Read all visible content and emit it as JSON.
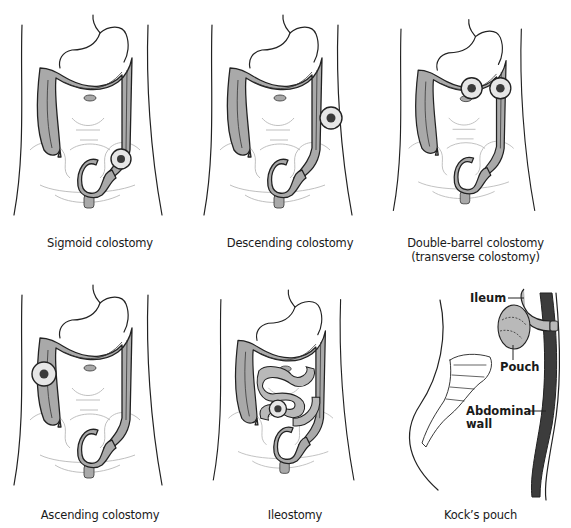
{
  "figure": {
    "type": "medical-illustration",
    "panels": [
      {
        "id": "sigmoid",
        "caption_lines": [
          "Sigmoid colostomy"
        ],
        "stoma": "sigmoid"
      },
      {
        "id": "descending",
        "caption_lines": [
          "Descending colostomy"
        ],
        "stoma": "descending"
      },
      {
        "id": "double-barrel",
        "caption_lines": [
          "Double-barrel colostomy",
          "(transverse colostomy)"
        ],
        "stoma": "transverse-double"
      },
      {
        "id": "ascending",
        "caption_lines": [
          "Ascending colostomy"
        ],
        "stoma": "ascending"
      },
      {
        "id": "ileostomy",
        "caption_lines": [
          "Ileostomy"
        ],
        "stoma": "ileum"
      },
      {
        "id": "kocks-pouch",
        "caption_lines": [
          "Kock’s pouch"
        ],
        "callouts": {
          "ileum": "Ileum",
          "pouch": "Pouch",
          "abdominal_wall_1": "Abdominal",
          "abdominal_wall_2": "wall"
        }
      }
    ]
  },
  "colors": {
    "colon_fill": "#a9a9a9",
    "outline": "#222222",
    "faint_bone": "#b8b8b8",
    "abdominal_wall": "#3c3c3c",
    "stoma_ring": "#e6e6e6"
  }
}
